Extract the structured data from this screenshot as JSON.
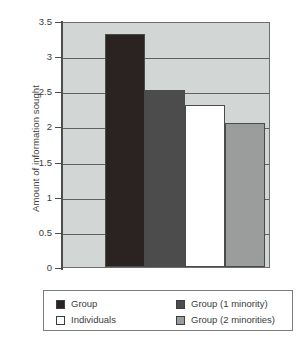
{
  "chart_data": {
    "type": "bar",
    "title": "",
    "xlabel": "",
    "ylabel": "Amount of information sought",
    "ylim": [
      0,
      3.5
    ],
    "yticks": [
      0,
      0.5,
      1,
      1.5,
      2,
      2.5,
      3,
      3.5
    ],
    "ytick_labels": [
      "0",
      "0.5",
      "1",
      "1.5",
      "2",
      "2.5",
      "3",
      "3.5"
    ],
    "grid": true,
    "legend_position": "bottom",
    "categories": [
      "Group",
      "Group (1 minority)",
      "Individuals",
      "Group (2 minorities)"
    ],
    "values": [
      3.32,
      2.52,
      2.3,
      2.05
    ],
    "series": [
      {
        "name": "Amount of information sought",
        "values": [
          3.32,
          2.52,
          2.3,
          2.05
        ]
      }
    ],
    "bars": [
      {
        "label": "Group",
        "value": 3.32,
        "color": "#2b2321"
      },
      {
        "label": "Group (1 minority)",
        "value": 2.52,
        "color": "#4c4c4c"
      },
      {
        "label": "Individuals",
        "value": 2.3,
        "color": "#ffffff"
      },
      {
        "label": "Group (2 minorities)",
        "value": 2.05,
        "color": "#9b9d9c"
      }
    ],
    "plot_background": "#d2d6d4"
  },
  "legend": {
    "items": [
      {
        "label": "Group",
        "color": "#2b2321"
      },
      {
        "label": "Individuals",
        "color": "#ffffff"
      },
      {
        "label": "Group (1 minority)",
        "color": "#4c4c4c"
      },
      {
        "label": "Group (2 minorities)",
        "color": "#9b9d9c"
      }
    ]
  }
}
